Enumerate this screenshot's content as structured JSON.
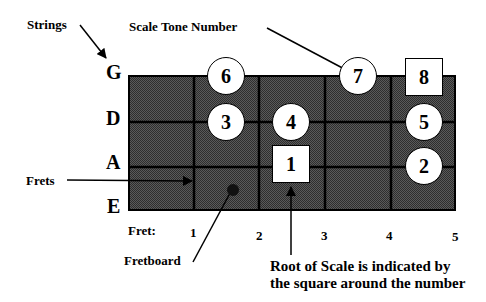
{
  "annotations": {
    "strings": "Strings",
    "scale_tone_number": "Scale Tone Number",
    "frets": "Frets",
    "fretboard": "Fretboard",
    "root_note_line1": "Root of Scale is indicated by",
    "root_note_line2": "the square around the number"
  },
  "strings": [
    {
      "name": "G",
      "y": 76
    },
    {
      "name": "D",
      "y": 122
    },
    {
      "name": "A",
      "y": 167
    },
    {
      "name": "E",
      "y": 210
    }
  ],
  "fret_label": "Fret:",
  "frets": [
    {
      "number": "1",
      "x": 194
    },
    {
      "number": "2",
      "x": 259
    },
    {
      "number": "3",
      "x": 325
    },
    {
      "number": "4",
      "x": 391
    },
    {
      "number": "5",
      "x": 455
    }
  ],
  "scale_tones": [
    {
      "tone": "1",
      "string": "A",
      "fret": 3,
      "shape": "square"
    },
    {
      "tone": "2",
      "string": "A",
      "fret": 5,
      "shape": "circle"
    },
    {
      "tone": "3",
      "string": "D",
      "fret": 2,
      "shape": "circle"
    },
    {
      "tone": "4",
      "string": "D",
      "fret": 3,
      "shape": "circle"
    },
    {
      "tone": "5",
      "string": "D",
      "fret": 5,
      "shape": "circle"
    },
    {
      "tone": "6",
      "string": "G",
      "fret": 2,
      "shape": "circle"
    },
    {
      "tone": "7",
      "string": "G",
      "fret": 4,
      "shape": "circle"
    },
    {
      "tone": "8",
      "string": "G",
      "fret": 5,
      "shape": "square"
    }
  ],
  "colors": {
    "fretboard": "#4a4a4a",
    "lines": "#000000",
    "note_fill": "#ffffff"
  }
}
